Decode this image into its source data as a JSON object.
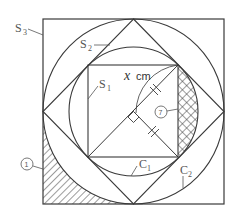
{
  "figure": {
    "labels": {
      "s3": {
        "base": "S",
        "sub": "3"
      },
      "s2": {
        "base": "S",
        "sub": "2"
      },
      "s1": {
        "base": "S",
        "sub": "1"
      },
      "c1": {
        "base": "C",
        "sub": "1"
      },
      "c2": {
        "base": "C",
        "sub": "2"
      },
      "length_var": "x",
      "length_unit": "cm",
      "region_1": "1",
      "region_7": "7"
    },
    "colors": {
      "stroke": "#3a3a3a",
      "label": "#555555",
      "background": "#ffffff"
    },
    "shapes": {
      "outer_square": "S3",
      "outer_circle": "C2",
      "diamond_square": "S2",
      "inner_circle": "C1",
      "inner_square": "S1"
    },
    "hatched_regions": [
      {
        "id": "1",
        "pattern": "diagonal-lines",
        "location": "bottom-left corner between S3 and C2"
      },
      {
        "id": "7",
        "pattern": "cross-hatch",
        "location": "right segment between S1 and C1"
      }
    ]
  }
}
